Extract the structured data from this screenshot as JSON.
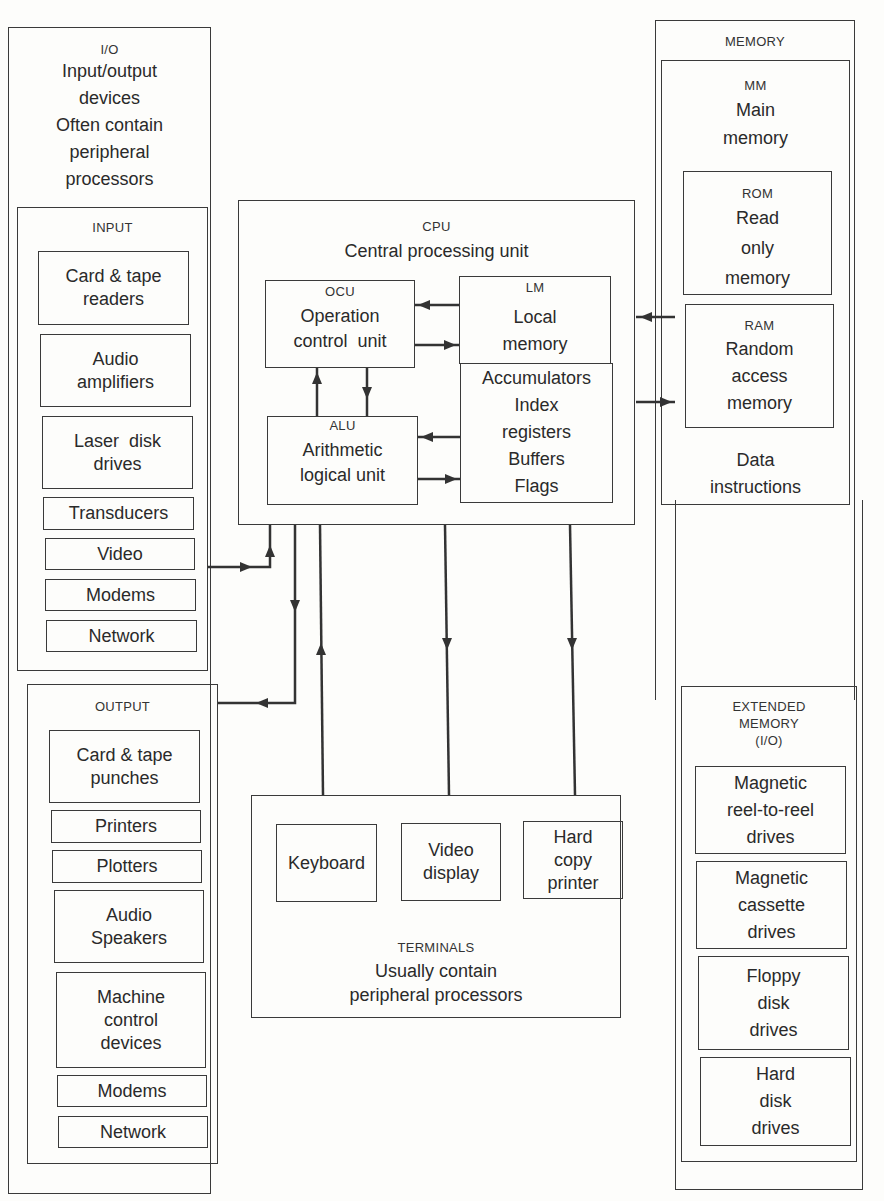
{
  "io": {
    "abbr": "I/O",
    "lines": [
      "Input/output",
      "devices",
      "Often contain",
      "peripheral",
      "processors"
    ]
  },
  "input": {
    "title": "INPUT",
    "items": [
      [
        "Card & tape",
        "readers"
      ],
      [
        "Audio",
        "amplifiers"
      ],
      [
        "Laser  disk",
        "drives"
      ],
      [
        "Transducers"
      ],
      [
        "Video"
      ],
      [
        "Modems"
      ],
      [
        "Network"
      ]
    ]
  },
  "output": {
    "title": "OUTPUT",
    "items": [
      [
        "Card & tape",
        "punches"
      ],
      [
        "Printers"
      ],
      [
        "Plotters"
      ],
      [
        "Audio",
        "Speakers"
      ],
      [
        "Machine",
        "control",
        "devices"
      ],
      [
        "Modems"
      ],
      [
        "Network"
      ]
    ]
  },
  "cpu": {
    "abbr": "CPU",
    "name": "Central processing unit",
    "ocu": {
      "abbr": "OCU",
      "lines": [
        "Operation",
        "control  unit"
      ]
    },
    "alu": {
      "abbr": "ALU",
      "lines": [
        "Arithmetic",
        "logical unit"
      ]
    },
    "lm": {
      "abbr": "LM",
      "lines": [
        "Local",
        "memory"
      ]
    },
    "registers": {
      "lines": [
        "Accumulators",
        "Index",
        "registers",
        "Buffers",
        "Flags"
      ]
    }
  },
  "memory": {
    "title": "MEMORY",
    "mm": {
      "abbr": "MM",
      "lines": [
        "Main",
        "memory"
      ]
    },
    "rom": {
      "abbr": "ROM",
      "lines": [
        "Read",
        "only",
        "memory"
      ]
    },
    "ram": {
      "abbr": "RAM",
      "lines": [
        "Random",
        "access",
        "memory"
      ]
    },
    "data": [
      "Data",
      "instructions"
    ]
  },
  "extended": {
    "title": [
      "EXTENDED",
      "MEMORY",
      "(I/O)"
    ],
    "items": [
      [
        "Magnetic",
        "reel-to-reel",
        "drives"
      ],
      [
        "Magnetic",
        "cassette",
        "drives"
      ],
      [
        "Floppy",
        "disk",
        "drives"
      ],
      [
        "Hard",
        "disk",
        "drives"
      ]
    ]
  },
  "terminals": {
    "items": [
      [
        "Keyboard"
      ],
      [
        "Video",
        "display"
      ],
      [
        "Hard",
        "copy",
        "printer"
      ]
    ],
    "title": "TERMINALS",
    "lines": [
      "Usually contain",
      "peripheral processors"
    ]
  },
  "colors": {
    "ink": "#3a3a3a",
    "paper": "#fdfdfb"
  }
}
